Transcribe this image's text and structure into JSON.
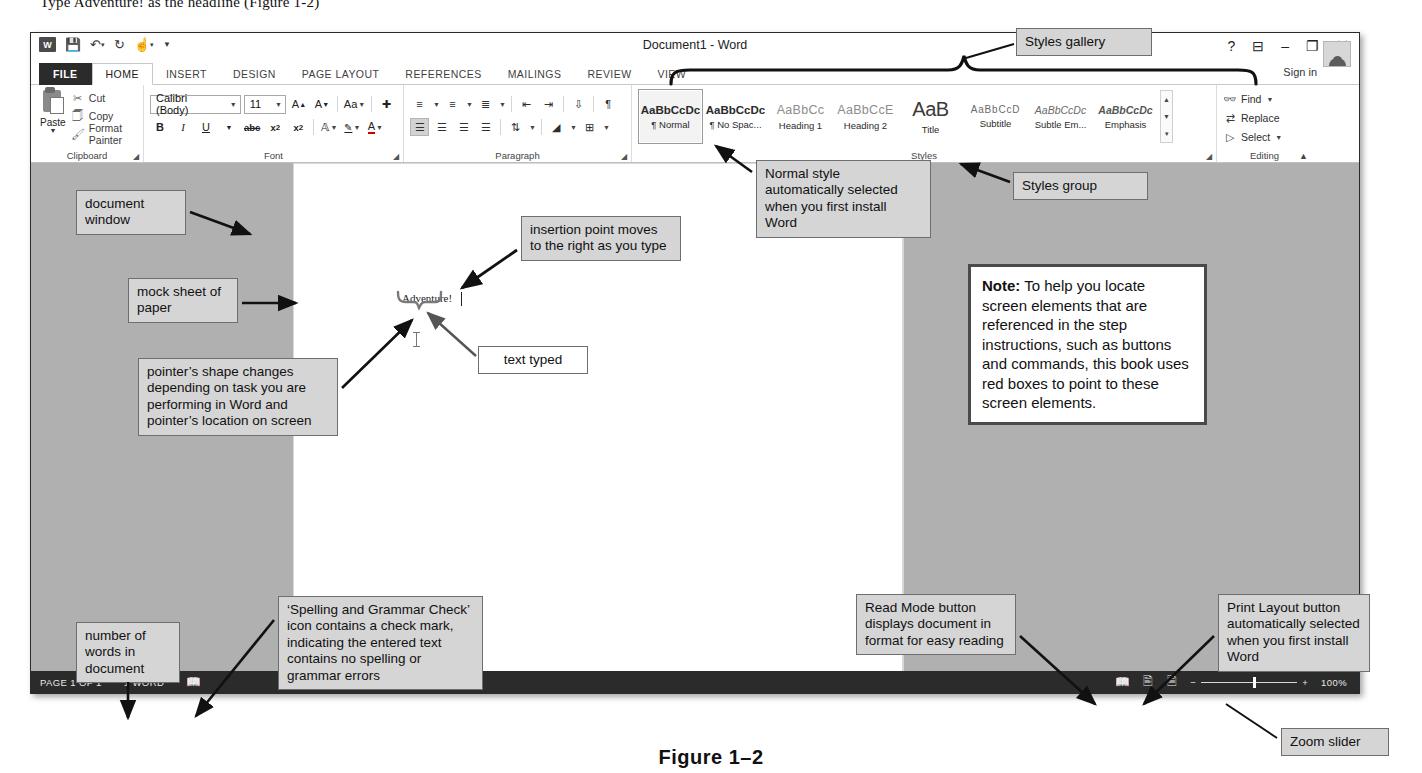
{
  "top_line": "Type  Adventure!  as the headline (Figure 1-2)",
  "figure_caption": "Figure 1–2",
  "window": {
    "title": "Document1 - Word",
    "quick_access": [
      "word-logo",
      "save-icon",
      "undo-icon",
      "redo-icon",
      "touch-mode-icon",
      "customize-qat-icon"
    ],
    "controls": [
      "?",
      "ribbon-display-options",
      "minimize",
      "restore",
      "close"
    ],
    "sign_in": "Sign in"
  },
  "tabs": [
    {
      "label": "FILE",
      "state": "file"
    },
    {
      "label": "HOME",
      "state": "active"
    },
    {
      "label": "INSERT",
      "state": "normal"
    },
    {
      "label": "DESIGN",
      "state": "normal"
    },
    {
      "label": "PAGE LAYOUT",
      "state": "normal"
    },
    {
      "label": "REFERENCES",
      "state": "normal"
    },
    {
      "label": "MAILINGS",
      "state": "normal"
    },
    {
      "label": "REVIEW",
      "state": "normal"
    },
    {
      "label": "VIEW",
      "state": "normal"
    }
  ],
  "ribbon": {
    "clipboard": {
      "label": "Clipboard",
      "paste": "Paste",
      "items": [
        {
          "icon": "scissors-icon",
          "glyph": "✂",
          "label": "Cut"
        },
        {
          "icon": "copy-icon",
          "glyph": "❐",
          "label": "Copy"
        },
        {
          "icon": "format-painter-icon",
          "glyph": "✐",
          "label": "Format Painter"
        }
      ]
    },
    "font": {
      "label": "Font",
      "font_name": "Calibri (Body)",
      "font_size": "11",
      "row1": [
        {
          "name": "grow-font-icon",
          "glyph": "A˄"
        },
        {
          "name": "shrink-font-icon",
          "glyph": "Aˇ"
        },
        {
          "name": "change-case-icon",
          "glyph": "Aa"
        },
        {
          "name": "clear-formatting-icon",
          "glyph": "✐"
        }
      ],
      "row2": [
        {
          "name": "bold-button",
          "glyph": "B"
        },
        {
          "name": "italic-button",
          "glyph": "I"
        },
        {
          "name": "underline-button",
          "glyph": "U"
        },
        {
          "name": "strikethrough-button",
          "glyph": "abc"
        },
        {
          "name": "subscript-button",
          "glyph": "x₂"
        },
        {
          "name": "superscript-button",
          "glyph": "x²"
        },
        {
          "name": "text-effects-icon",
          "glyph": "A"
        },
        {
          "name": "text-highlight-icon",
          "glyph": "ab"
        },
        {
          "name": "font-color-icon",
          "glyph": "A"
        }
      ]
    },
    "paragraph": {
      "label": "Paragraph",
      "row1": [
        {
          "name": "bullets-icon",
          "glyph": "☰"
        },
        {
          "name": "numbering-icon",
          "glyph": "☰"
        },
        {
          "name": "multilevel-list-icon",
          "glyph": "☰"
        },
        {
          "name": "decrease-indent-icon",
          "glyph": "⇤"
        },
        {
          "name": "increase-indent-icon",
          "glyph": "⇥"
        },
        {
          "name": "sort-icon",
          "glyph": "↓"
        },
        {
          "name": "show-formatting-marks-icon",
          "glyph": "¶"
        }
      ],
      "row2": [
        {
          "name": "align-left-button",
          "glyph": "☰"
        },
        {
          "name": "align-center-button",
          "glyph": "☰"
        },
        {
          "name": "align-right-button",
          "glyph": "☰"
        },
        {
          "name": "justify-button",
          "glyph": "☰"
        },
        {
          "name": "line-spacing-icon",
          "glyph": "↕"
        },
        {
          "name": "shading-icon",
          "glyph": "◢"
        },
        {
          "name": "borders-icon",
          "glyph": "⊞"
        }
      ]
    },
    "styles": {
      "label": "Styles",
      "gallery": [
        {
          "preview": "AaBbCcDc",
          "name": "¶ Normal",
          "selected": true
        },
        {
          "preview": "AaBbCcDc",
          "name": "¶ No Spac...",
          "selected": false
        },
        {
          "preview": "AaBbCc",
          "name": "Heading 1",
          "selected": false
        },
        {
          "preview": "AaBbCcE",
          "name": "Heading 2",
          "selected": false
        },
        {
          "preview": "AaB",
          "name": "Title",
          "selected": false
        },
        {
          "preview": "AaBbCcD",
          "name": "Subtitle",
          "selected": false
        },
        {
          "preview": "AaBbCcDc",
          "name": "Subtle Em...",
          "selected": false
        },
        {
          "preview": "AaBbCcDc",
          "name": "Emphasis",
          "selected": false
        }
      ]
    },
    "editing": {
      "label": "Editing",
      "items": [
        {
          "icon": "find-icon",
          "glyph": "⌕",
          "label": "Find"
        },
        {
          "icon": "replace-icon",
          "glyph": "⇄",
          "label": "Replace"
        },
        {
          "icon": "select-icon",
          "glyph": "➤",
          "label": "Select"
        }
      ]
    }
  },
  "document": {
    "typed_text": "Adventure!"
  },
  "status_bar": {
    "page": "PAGE 1 OF 1",
    "words": "1 WORD",
    "proofing_icon": "spelling-and-grammar-check-icon",
    "read_mode_icon": "read-mode-icon",
    "print_layout_icon": "print-layout-icon",
    "web_layout_icon": "web-layout-icon",
    "zoom_out": "−",
    "zoom_in": "+",
    "zoom_level": "100%"
  },
  "annotations": {
    "styles_gallery": "Styles gallery",
    "styles_group": "Styles group",
    "normal_style": "Normal style automatically selected when you first install Word",
    "document_window": "document window",
    "mock_sheet": "mock sheet of paper",
    "pointer_shape": "pointer’s shape changes depending on task you are performing in Word and pointer’s location on screen",
    "insertion_point": "insertion point moves to the right as you type",
    "text_typed": "text typed",
    "note_label": "Note:",
    "note_body": " To help you locate screen elements that are referenced in the step instructions, such as buttons and commands, this book uses red boxes to point to these screen elements.",
    "word_count": "number of words in document",
    "spelling_grammar": "‘Spelling and Grammar Check’ icon contains a check mark, indicating the entered text contains no spelling or grammar errors",
    "read_mode": "Read Mode button displays document in format for easy reading",
    "print_layout": "Print Layout button automatically selected when you first install Word",
    "zoom_slider": "Zoom slider"
  }
}
